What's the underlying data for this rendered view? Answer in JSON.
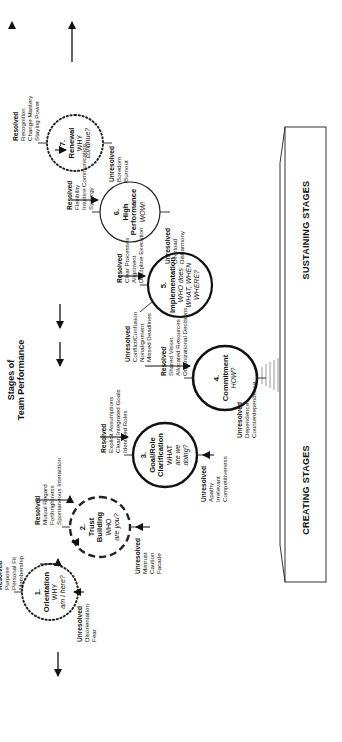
{
  "title": {
    "line1": "Stages of",
    "line2": "Team Performance"
  },
  "stages": [
    {
      "num": "1.",
      "name": "Orientation",
      "q1": "WHY",
      "q2": "am I here?",
      "style": "dotted",
      "resolved": {
        "head": "Resolved",
        "items": [
          "Purpose",
          "Personal Fit",
          "Membership"
        ]
      },
      "unresolved": {
        "head": "Unresolved",
        "items": [
          "Disorientation",
          "Fear"
        ]
      }
    },
    {
      "num": "2.",
      "name": "Trust",
      "name2": "Building",
      "q1": "WHO",
      "q2": "are you?",
      "style": "dashed",
      "resolved": {
        "head": "Resolved",
        "items": [
          "Mutual Regard",
          "Forthrightness",
          "Spontaneous Interaction"
        ]
      },
      "unresolved": {
        "head": "Unresolved",
        "items": [
          "Mistrust",
          "Caution",
          "Facade"
        ]
      }
    },
    {
      "num": "3.",
      "name": "Goal/Role",
      "name2": "Clarification",
      "q1": "WHAT",
      "q2": "are we",
      "q3": "doing?",
      "style": "solid",
      "resolved": {
        "head": "Resolved",
        "items": [
          "Explicit Assumptions",
          "Clear, Integrated Goals",
          "Identified Roles"
        ]
      },
      "unresolved": {
        "head": "Unresolved",
        "items": [
          "Apathy",
          "Irrelevant",
          "Competitiveness"
        ]
      }
    },
    {
      "num": "4.",
      "name": "Commitment",
      "q1": "HOW?",
      "style": "solid",
      "resolved": {
        "head": "Resolved",
        "items": [
          "Shared Vision",
          "Allocated Resources",
          "Organizational Decisions"
        ]
      },
      "unresolved": {
        "head": "Unresolved",
        "items": [
          "Dependence",
          "Counterdependence"
        ]
      }
    },
    {
      "num": "5.",
      "name": "Implementation",
      "q1": "WHO does",
      "q2": "WHAT, WHEN",
      "q3": "WHERE?",
      "style": "solid",
      "resolved": {
        "head": "Resolved",
        "items": [
          "Clear Processes",
          "Alignment",
          "Discipline Execution"
        ]
      },
      "unresolved": {
        "head": "Unresolved",
        "items": [
          "Conflict/Confusion",
          "Nonalignment",
          "Missed Deadlines"
        ]
      }
    },
    {
      "num": "6.",
      "name": "High",
      "name2": "Performance",
      "q1": "WOW!",
      "style": "thin",
      "resolved": {
        "head": "Resolved",
        "items": [
          "Flexibility",
          "Intuitive Communication",
          "Synergy"
        ]
      },
      "unresolved": {
        "head": "Unresolved",
        "items": [
          "Overload",
          "Disharmony"
        ]
      }
    },
    {
      "num": "7.",
      "name": "Renewal",
      "q1": "WHY",
      "q2": "continue?",
      "style": "dotted",
      "resolved": {
        "head": "Resolved",
        "items": [
          "Recognition",
          "Change Mastery",
          "Staying Power"
        ]
      },
      "unresolved": {
        "head": "Unresolved",
        "items": [
          "Boredom",
          "Burnout"
        ]
      }
    }
  ],
  "platform": {
    "creating": "CREATING STAGES",
    "sustaining": "SUSTAINING STAGES"
  }
}
